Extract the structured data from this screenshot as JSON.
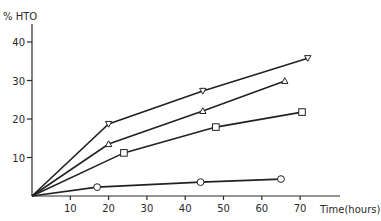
{
  "chart_data": {
    "type": "line",
    "title": "",
    "xlabel": "Time(hours)",
    "ylabel": "% HTO",
    "xlim": [
      0,
      72
    ],
    "ylim": [
      0,
      45
    ],
    "xticks": [
      10,
      20,
      30,
      40,
      50,
      60,
      70
    ],
    "yticks": [
      10,
      20,
      30,
      40
    ],
    "grid": false,
    "legend": null,
    "series": [
      {
        "name": "inverted-triangle",
        "marker": "triangle-down",
        "points": [
          [
            0,
            0
          ],
          [
            20,
            18.7
          ],
          [
            44.6,
            27.3
          ],
          [
            72,
            35.8
          ]
        ]
      },
      {
        "name": "triangle",
        "marker": "triangle-up",
        "points": [
          [
            0,
            0
          ],
          [
            20,
            13.5
          ],
          [
            44.6,
            22.1
          ],
          [
            66,
            29.9
          ]
        ]
      },
      {
        "name": "square",
        "marker": "square",
        "points": [
          [
            0,
            0
          ],
          [
            24,
            11.2
          ],
          [
            48,
            17.9
          ],
          [
            70.5,
            21.8
          ]
        ]
      },
      {
        "name": "circle",
        "marker": "circle",
        "points": [
          [
            0,
            0
          ],
          [
            17,
            2.3
          ],
          [
            44,
            3.6
          ],
          [
            65,
            4.4
          ]
        ]
      }
    ]
  },
  "axes": {
    "y_title": "% HTO",
    "x_title": "Time(hours)",
    "x_tick_labels": [
      "10",
      "20",
      "30",
      "40",
      "50",
      "60",
      "70"
    ],
    "y_tick_labels": [
      "10",
      "20",
      "30",
      "40"
    ]
  }
}
